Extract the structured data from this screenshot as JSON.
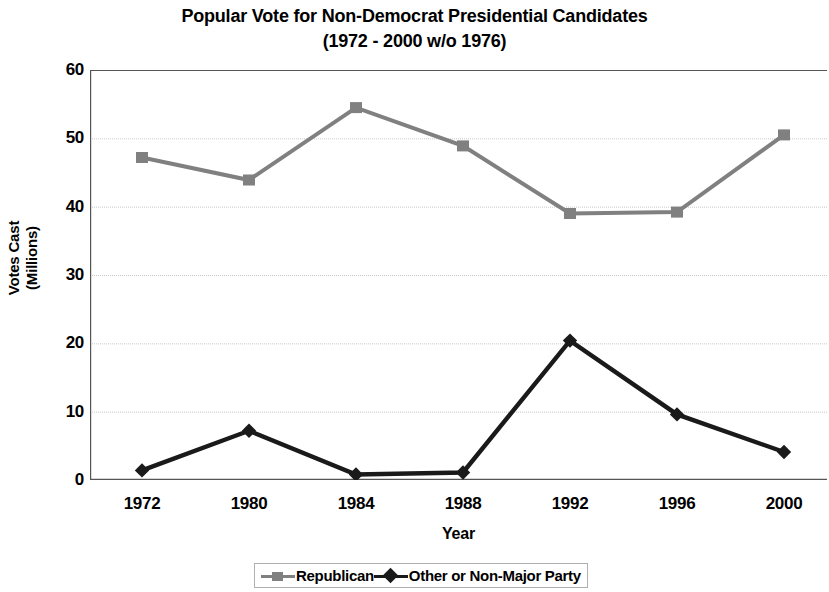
{
  "chart_data": {
    "type": "line",
    "title": "Popular Vote for Non-Democrat Presidential Candidates",
    "subtitle": "(1972 - 2000 w/o 1976)",
    "xlabel": "Year",
    "ylabel_line1": "Votes Cast",
    "ylabel_line2": "(Millions)",
    "categories": [
      "1972",
      "1980",
      "1984",
      "1988",
      "1992",
      "1996",
      "2000"
    ],
    "series": [
      {
        "name": "Republican",
        "marker": "square",
        "color": "#808080",
        "values": [
          47.2,
          43.9,
          54.5,
          48.9,
          39.0,
          39.2,
          50.5
        ]
      },
      {
        "name": "Other or Non-Major Party",
        "marker": "diamond",
        "color": "#1a1a1a",
        "values": [
          1.4,
          7.2,
          0.8,
          1.1,
          20.4,
          9.6,
          4.1
        ]
      }
    ],
    "ylim": [
      0,
      60
    ],
    "yticks": [
      0,
      10,
      20,
      30,
      40,
      50,
      60
    ],
    "ytick_labels": [
      "0",
      "10",
      "20",
      "30",
      "40",
      "50",
      "60"
    ],
    "grid": true,
    "grid_color": "#c8c8c8",
    "axis_color": "#555555",
    "legend_position": "bottom",
    "plot_background": "#ffffff"
  }
}
